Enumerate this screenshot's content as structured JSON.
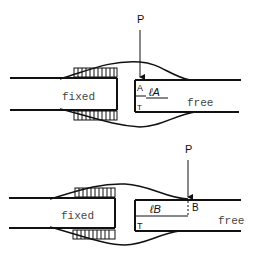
{
  "diagrams": [
    {
      "id": "A",
      "load_label": "P",
      "fixed_label": "fixed",
      "free_label": "free",
      "point_label": "A",
      "length_label": "ℓA",
      "torque_label": "T"
    },
    {
      "id": "B",
      "load_label": "P",
      "fixed_label": "fixed",
      "free_label": "free",
      "point_label": "B",
      "length_label": "ℓB",
      "torque_label": "T"
    }
  ],
  "colors": {
    "line": "#111111",
    "background": "#ffffff",
    "label": "#444444"
  }
}
